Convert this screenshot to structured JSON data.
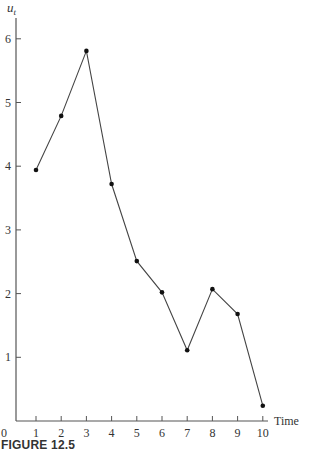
{
  "chart_data": {
    "type": "line",
    "title": "",
    "xlabel": "Time",
    "ylabel": "u_t",
    "x": [
      1,
      2,
      3,
      4,
      5,
      6,
      7,
      8,
      9,
      10
    ],
    "categories": [
      "1",
      "2",
      "3",
      "4",
      "5",
      "6",
      "7",
      "8",
      "9",
      "10"
    ],
    "series": [
      {
        "name": "u_t",
        "values": [
          3.94,
          4.79,
          5.81,
          3.72,
          2.51,
          2.02,
          1.11,
          2.07,
          1.68,
          0.24
        ]
      }
    ],
    "xticks": [
      "1",
      "2",
      "3",
      "4",
      "5",
      "6",
      "7",
      "8",
      "9",
      "10"
    ],
    "yticks": [
      "1",
      "2",
      "3",
      "4",
      "5",
      "6"
    ],
    "origin_label": "0",
    "ylim": [
      0,
      6.3
    ],
    "xlim": [
      0,
      10.6
    ],
    "grid": false,
    "legend": "none",
    "markers": true
  },
  "figure": {
    "caption": "FIGURE 12.5",
    "ylabel_main": "u",
    "ylabel_sub": "t",
    "xlabel": "Time",
    "origin": "0"
  }
}
